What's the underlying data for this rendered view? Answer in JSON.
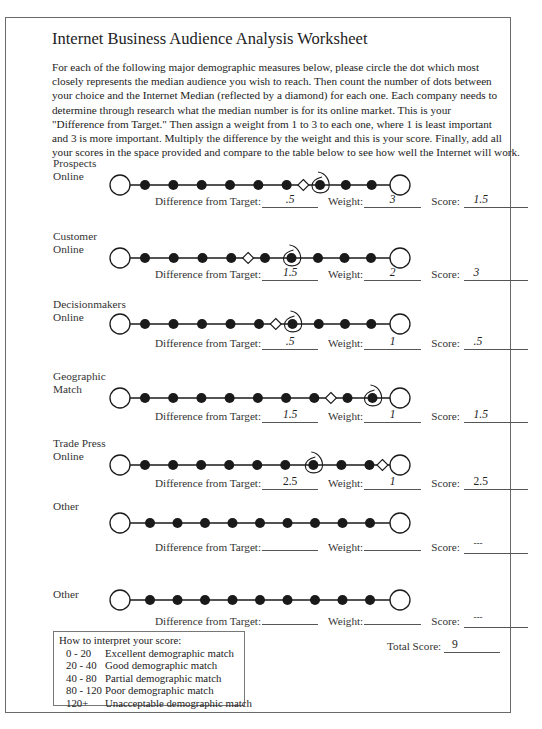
{
  "document": {
    "title": "Internet Business Audience Analysis Worksheet",
    "intro_lines": [
      "For each of the following major demographic measures below, please circle the dot which most",
      "closely represents the median audience you wish to reach.  Then count the number of dots between",
      "your choice and the Internet Median (reflected by a diamond) for each one.  Each company needs to",
      "determine through research what the median number is for its online market.  This is your",
      "\"Difference from Target.\"  Then assign a weight from 1 to 3 to each one, where 1 is least important",
      "and 3 is more important.  Multiply the difference by the weight and this is your score.  Finally, add all",
      "your scores in the space provided and compare to the table below to see how well the Internet will work."
    ]
  },
  "labels": {
    "difference": "Difference from Target:",
    "weight": "Weight:",
    "score": "Score:",
    "total": "Total Score:"
  },
  "rows": [
    {
      "label_lines": [
        "Prospects",
        "Online"
      ],
      "filled_dots": 9,
      "circled_dot": 7,
      "diamond_after_dot": 6,
      "difference": ".5",
      "weight": "3",
      "score": "1.5"
    },
    {
      "label_lines": [
        "Customer",
        "Online"
      ],
      "filled_dots": 9,
      "circled_dot": 6,
      "diamond_after_dot": 4,
      "difference": "1.5",
      "weight": "2",
      "score": "3"
    },
    {
      "label_lines": [
        "Decisionmakers",
        "Online"
      ],
      "filled_dots": 9,
      "circled_dot": 6,
      "diamond_after_dot": 5,
      "difference": ".5",
      "weight": "1",
      "score": ".5"
    },
    {
      "label_lines": [
        "Geographic",
        "Match"
      ],
      "filled_dots": 9,
      "circled_dot": 9,
      "diamond_after_dot": 7,
      "difference": "1.5",
      "weight": "1",
      "score": "1.5"
    },
    {
      "label_lines": [
        "Trade Press",
        "Online"
      ],
      "filled_dots": 9,
      "circled_dot": 7,
      "diamond_after_dot": 9,
      "difference": "2.5",
      "weight": "1",
      "score": "2.5"
    },
    {
      "label_lines": [
        "Other",
        ""
      ],
      "filled_dots": 9,
      "circled_dot": null,
      "diamond_after_dot": null,
      "difference": "",
      "weight": "",
      "score": "---"
    },
    {
      "label_lines": [
        "Other",
        ""
      ],
      "filled_dots": 9,
      "circled_dot": null,
      "diamond_after_dot": null,
      "difference": "",
      "weight": "",
      "score": "---"
    }
  ],
  "total_score": "9",
  "legend": {
    "heading": "How to interpret your score:",
    "items": [
      {
        "range": "0 - 20",
        "meaning": "Excellent demographic match"
      },
      {
        "range": "20 - 40",
        "meaning": "Good demographic match"
      },
      {
        "range": "40 - 80",
        "meaning": "Partial demographic match"
      },
      {
        "range": "80 - 120",
        "meaning": "Poor demographic match"
      },
      {
        "range": "120+",
        "meaning": "Unacceptable demographic match"
      }
    ]
  },
  "colors": {
    "ink": "#1a1a1a",
    "border": "#6a6a6a",
    "background": "#ffffff"
  }
}
